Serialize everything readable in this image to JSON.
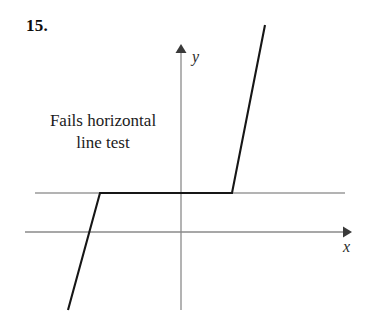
{
  "figure": {
    "problem_number": "15.",
    "width": 378,
    "height": 324,
    "background_color": "#ffffff"
  },
  "caption": {
    "line1": "Fails horizontal",
    "line2": "line test"
  },
  "axes": {
    "x_label": "x",
    "y_label": "y",
    "color": "#8a8a8a",
    "origin": {
      "x": 181,
      "y": 232
    },
    "x_axis": {
      "x_start": 25,
      "x_end": 352,
      "y": 232,
      "arrow": "right"
    },
    "y_axis": {
      "x": 181,
      "y_start": 45,
      "y_end": 310,
      "arrow": "up"
    }
  },
  "chart_data": {
    "type": "line",
    "title": "Fails horizontal line test",
    "xlabel": "x",
    "ylabel": "y",
    "grid": false,
    "legend": false,
    "series": [
      {
        "name": "piecewise-function",
        "color": "#161616",
        "linewidth": 2.1,
        "points_px": [
          [
            68,
            310
          ],
          [
            100,
            193
          ],
          [
            232,
            193
          ],
          [
            265,
            25
          ]
        ],
        "description": "Piecewise curve: steep rising segment, flat plateau, steep rising segment"
      },
      {
        "name": "horizontal-test-line",
        "color": "#9a9a9a",
        "linewidth": 1.4,
        "points_px": [
          [
            35,
            193
          ],
          [
            345,
            193
          ]
        ],
        "description": "Gray horizontal test line crossing the flat plateau"
      }
    ]
  }
}
